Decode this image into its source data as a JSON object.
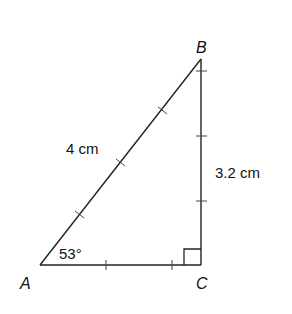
{
  "diagram": {
    "type": "right-triangle",
    "vertices": {
      "A": {
        "label": "A",
        "x": 40,
        "y": 265
      },
      "B": {
        "label": "B",
        "x": 201,
        "y": 59
      },
      "C": {
        "label": "C",
        "x": 201,
        "y": 265
      }
    },
    "labels": {
      "A": "A",
      "B": "B",
      "C": "C",
      "hypotenuse": "4 cm",
      "vertical_side": "3.2 cm",
      "angle_A": "53°"
    },
    "right_angle_at": "C",
    "colors": {
      "stroke": "#222222",
      "background": "#ffffff"
    }
  }
}
